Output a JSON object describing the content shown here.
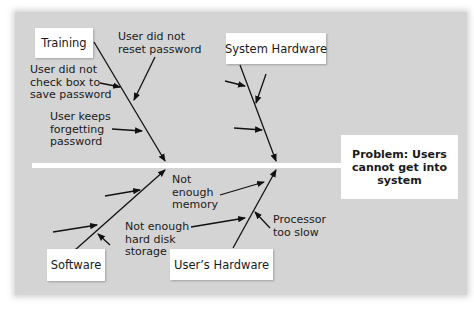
{
  "problem": {
    "line1": "Problem: Users",
    "line2": "cannot get into",
    "line3": "system"
  },
  "categories": {
    "training": "Training",
    "system_hardware": "System Hardware",
    "software": "Software",
    "users_hardware": "User’s Hardware"
  },
  "causes": {
    "reset_password": [
      "User did not",
      "reset password"
    ],
    "check_box": [
      "User did not",
      "check box to",
      "save password"
    ],
    "forgetting": [
      "User keeps",
      "forgetting",
      "password"
    ],
    "memory": [
      "Not",
      "enough",
      "memory"
    ],
    "hard_disk": [
      "Not enough",
      "hard disk",
      "storage"
    ],
    "processor": [
      "Processor",
      "too slow"
    ]
  },
  "colors": {
    "panel": "#d4d4d4",
    "box": "#ffffff",
    "line": "#111111",
    "spine": "#ffffff"
  }
}
